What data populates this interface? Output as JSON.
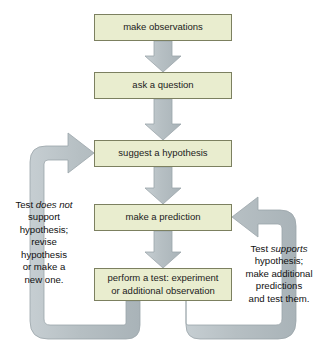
{
  "diagram": {
    "colors": {
      "box_fill": "#e9edcf",
      "box_border": "#7c8060",
      "arrow_fill": "#b9c1c5",
      "arrow_stroke": "#9aa4a9",
      "text": "#101010",
      "background": "#ffffff"
    },
    "steps": [
      {
        "id": "observations",
        "label": "make observations"
      },
      {
        "id": "question",
        "label": "ask a question"
      },
      {
        "id": "hypothesis",
        "label": "suggest a hypothesis"
      },
      {
        "id": "prediction",
        "label": "make a prediction"
      },
      {
        "id": "test",
        "label": "perform a test: experiment\nor additional observation"
      }
    ],
    "notes": {
      "left": {
        "id": "test-does-not-support",
        "line1_prefix": "Test ",
        "line1_emphasis": "does not",
        "rest": "support\nhypothesis;\nrevise\nhypothesis\nor make a\nnew one."
      },
      "right": {
        "id": "test-supports",
        "line1_prefix": "Test ",
        "line1_emphasis": "supports",
        "rest": "hypothesis;\nmake additional\npredictions\nand test them."
      }
    },
    "connectors": [
      {
        "id": "observations-to-question",
        "type": "straight-down-arrow",
        "from": "observations",
        "to": "question"
      },
      {
        "id": "question-to-hypothesis",
        "type": "straight-down-arrow",
        "from": "question",
        "to": "hypothesis"
      },
      {
        "id": "hypothesis-to-prediction",
        "type": "straight-down-arrow",
        "from": "hypothesis",
        "to": "prediction"
      },
      {
        "id": "prediction-to-test",
        "type": "straight-down-arrow",
        "from": "prediction",
        "to": "test"
      },
      {
        "id": "test-to-hypothesis-loop",
        "type": "left-loop-arrow",
        "from": "test",
        "to": "hypothesis"
      },
      {
        "id": "test-to-prediction-loop",
        "type": "right-loop-arrow",
        "from": "test",
        "to": "prediction"
      }
    ]
  }
}
